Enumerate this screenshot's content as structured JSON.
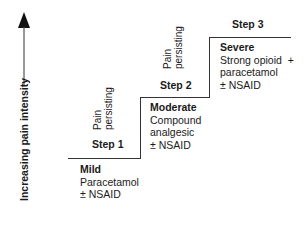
{
  "axis": {
    "label": "Increasing pain intensity",
    "arrow_icon": "arrow-up-icon"
  },
  "transition_label": {
    "line1": "Pain",
    "line2": "persisting"
  },
  "steps": [
    {
      "step": "Step 1",
      "level": "Mild",
      "lines": [
        "Paracetamol",
        "± NSAID"
      ]
    },
    {
      "step": "Step 2",
      "level": "Moderate",
      "lines": [
        "Compound",
        "analgesic",
        "± NSAID"
      ]
    },
    {
      "step": "Step 3",
      "level": "Severe",
      "lines": [
        "Strong opioid  +",
        "paracetamol",
        "± NSAID"
      ]
    }
  ]
}
